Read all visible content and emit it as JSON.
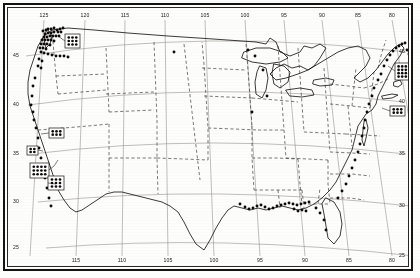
{
  "figure": {
    "type": "species-distribution-dot-map",
    "region": "Contiguous United States",
    "projection_note": "conic, curved graticule",
    "colors": {
      "paper": "#fdfdfb",
      "ink": "#15130f",
      "coastline": "#1a1814",
      "state_border": "#2b2823",
      "graticule": "#8d8a84",
      "dot": "#0d0c0a",
      "frame": "#15130f"
    }
  },
  "axes": {
    "longitude_label_top": [
      "125",
      "120",
      "115",
      "110",
      "105",
      "100",
      "95",
      "90",
      "85",
      "80",
      "75",
      "70"
    ],
    "longitude_label_bottom": [
      "115",
      "110",
      "105",
      "100",
      "95",
      "90",
      "85",
      "80",
      "75"
    ],
    "latitude_label_left": [
      "45",
      "40",
      "35",
      "30",
      "25"
    ],
    "latitude_label_right": [
      "45",
      "40",
      "35",
      "30",
      "25"
    ],
    "lon_range": [
      -127,
      -66
    ],
    "lat_range": [
      23,
      50
    ]
  },
  "chart_data": {
    "type": "scatter",
    "title": "",
    "xlabel": "",
    "ylabel": "",
    "legend": [],
    "grid": true,
    "graticule_lon": [
      -125,
      -120,
      -115,
      -110,
      -105,
      -100,
      -95,
      -90,
      -85,
      -80,
      -75,
      -70
    ],
    "graticule_lat": [
      45,
      40,
      35,
      30,
      25
    ],
    "point_count_approx": 120,
    "inset_boxes": [
      {
        "name": "puget-sound-inset",
        "cols": 3,
        "rows": 3,
        "x": 57,
        "y": 26,
        "w": 15,
        "h": 14
      },
      {
        "name": "north-california-inset",
        "cols": 3,
        "rows": 2,
        "x": 41,
        "y": 120,
        "w": 15,
        "h": 10
      },
      {
        "name": "san-francisco-inset",
        "cols": 2,
        "rows": 2,
        "x": 19,
        "y": 138,
        "w": 11,
        "h": 9
      },
      {
        "name": "central-california-inset",
        "cols": 4,
        "rows": 3,
        "x": 22,
        "y": 155,
        "w": 19,
        "h": 15
      },
      {
        "name": "southern-california-inset",
        "cols": 3,
        "rows": 3,
        "x": 40,
        "y": 168,
        "w": 16,
        "h": 14
      },
      {
        "name": "new-england-inset",
        "cols": 4,
        "rows": 4,
        "x": 387,
        "y": 55,
        "w": 18,
        "h": 17
      },
      {
        "name": "new-york-bight-inset",
        "cols": 3,
        "rows": 2,
        "x": 382,
        "y": 98,
        "w": 15,
        "h": 10
      }
    ],
    "clusters": [
      {
        "name": "pacific-northwest-coast",
        "points": 45
      },
      {
        "name": "california-coast",
        "points": 12
      },
      {
        "name": "gulf-coast",
        "points": 22
      },
      {
        "name": "south-atlantic-coast",
        "points": 10
      },
      {
        "name": "new-england-coast",
        "points": 18
      },
      {
        "name": "great-lakes-interior",
        "points": 4
      }
    ],
    "points": [
      [
        35,
        23
      ],
      [
        38,
        22
      ],
      [
        40,
        21
      ],
      [
        43,
        21
      ],
      [
        46,
        20
      ],
      [
        49,
        22
      ],
      [
        52,
        21
      ],
      [
        55,
        20
      ],
      [
        37,
        26
      ],
      [
        40,
        25
      ],
      [
        43,
        25
      ],
      [
        46,
        24
      ],
      [
        50,
        24
      ],
      [
        53,
        24
      ],
      [
        36,
        29
      ],
      [
        39,
        29
      ],
      [
        42,
        28
      ],
      [
        45,
        28
      ],
      [
        48,
        28
      ],
      [
        51,
        28
      ],
      [
        34,
        32
      ],
      [
        37,
        32
      ],
      [
        40,
        32
      ],
      [
        43,
        32
      ],
      [
        46,
        33
      ],
      [
        33,
        36
      ],
      [
        36,
        36
      ],
      [
        39,
        36
      ],
      [
        42,
        37
      ],
      [
        32,
        40
      ],
      [
        35,
        40
      ],
      [
        38,
        41
      ],
      [
        33,
        44
      ],
      [
        36,
        45
      ],
      [
        40,
        46
      ],
      [
        44,
        47
      ],
      [
        48,
        48
      ],
      [
        52,
        48
      ],
      [
        56,
        48
      ],
      [
        60,
        49
      ],
      [
        31,
        51
      ],
      [
        34,
        53
      ],
      [
        30,
        58
      ],
      [
        33,
        60
      ],
      [
        27,
        70
      ],
      [
        25,
        78
      ],
      [
        24,
        88
      ],
      [
        23,
        97
      ],
      [
        25,
        104
      ],
      [
        26,
        112
      ],
      [
        28,
        120
      ],
      [
        30,
        130
      ],
      [
        31,
        140
      ],
      [
        33,
        150
      ],
      [
        35,
        160
      ],
      [
        37,
        170
      ],
      [
        39,
        180
      ],
      [
        41,
        190
      ],
      [
        43,
        198
      ],
      [
        166,
        44
      ],
      [
        240,
        42
      ],
      [
        247,
        48
      ],
      [
        255,
        62
      ],
      [
        259,
        88
      ],
      [
        244,
        104
      ],
      [
        232,
        196
      ],
      [
        237,
        199
      ],
      [
        241,
        201
      ],
      [
        245,
        200
      ],
      [
        249,
        198
      ],
      [
        253,
        197
      ],
      [
        257,
        199
      ],
      [
        261,
        201
      ],
      [
        265,
        200
      ],
      [
        269,
        198
      ],
      [
        273,
        197
      ],
      [
        277,
        196
      ],
      [
        281,
        195
      ],
      [
        285,
        196
      ],
      [
        289,
        197
      ],
      [
        293,
        196
      ],
      [
        297,
        195
      ],
      [
        301,
        194
      ],
      [
        286,
        201
      ],
      [
        290,
        203
      ],
      [
        294,
        202
      ],
      [
        298,
        203
      ],
      [
        308,
        200
      ],
      [
        312,
        205
      ],
      [
        316,
        212
      ],
      [
        318,
        222
      ],
      [
        330,
        190
      ],
      [
        334,
        183
      ],
      [
        338,
        176
      ],
      [
        341,
        168
      ],
      [
        344,
        160
      ],
      [
        347,
        152
      ],
      [
        350,
        144
      ],
      [
        352,
        136
      ],
      [
        354,
        128
      ],
      [
        356,
        120
      ],
      [
        357,
        112
      ],
      [
        359,
        104
      ],
      [
        361,
        96
      ],
      [
        364,
        88
      ],
      [
        366,
        80
      ],
      [
        370,
        72
      ],
      [
        373,
        66
      ],
      [
        376,
        58
      ],
      [
        379,
        52
      ],
      [
        382,
        47
      ],
      [
        385,
        43
      ],
      [
        388,
        40
      ],
      [
        391,
        38
      ],
      [
        394,
        36
      ],
      [
        397,
        35
      ],
      [
        399,
        42
      ],
      [
        401,
        46
      ]
    ]
  }
}
